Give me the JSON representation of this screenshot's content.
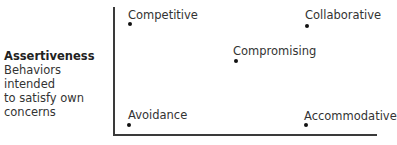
{
  "y_axis": {
    "title": "Assertiveness",
    "description_lines": [
      "Behaviors intended",
      "to satisfy own",
      "concerns"
    ]
  },
  "points": [
    {
      "label": "Competitive",
      "label_x": 128,
      "label_y": 9,
      "dot_x": 128,
      "dot_y": 22
    },
    {
      "label": "Collaborative",
      "label_x": 305,
      "label_y": 9,
      "dot_x": 305,
      "dot_y": 24
    },
    {
      "label": "Compromising",
      "label_x": 233,
      "label_y": 45,
      "dot_x": 234,
      "dot_y": 59
    },
    {
      "label": "Avoidance",
      "label_x": 128,
      "label_y": 109,
      "dot_x": 127,
      "dot_y": 123
    },
    {
      "label": "Accommodative",
      "label_x": 304,
      "label_y": 110,
      "dot_x": 304,
      "dot_y": 123
    }
  ],
  "colors": {
    "axis": "#3a3a3a",
    "text": "#333333",
    "dot": "#111111"
  }
}
